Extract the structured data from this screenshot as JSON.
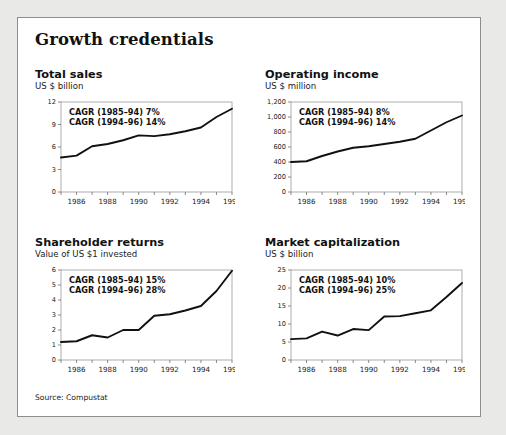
{
  "exhibit": {
    "title": "Growth credentials",
    "source": "Source: Compustat"
  },
  "panels": [
    {
      "id": "total-sales",
      "title": "Total sales",
      "subtitle": "US $ billion",
      "cagr_1": "CAGR (1985–94) 7%",
      "cagr_2": "CAGR (1994–96) 14%"
    },
    {
      "id": "operating-income",
      "title": "Operating income",
      "subtitle": "US $ million",
      "cagr_1": "CAGR (1985–94) 8%",
      "cagr_2": "CAGR (1994–96) 14%"
    },
    {
      "id": "shareholder-returns",
      "title": "Shareholder returns",
      "subtitle": "Value of US $1 invested",
      "cagr_1": "CAGR (1985–94) 15%",
      "cagr_2": "CAGR (1994–96) 28%"
    },
    {
      "id": "market-capitalization",
      "title": "Market capitalization",
      "subtitle": "US $ billion",
      "cagr_1": "CAGR (1985–94) 10%",
      "cagr_2": "CAGR (1994–96) 25%"
    }
  ],
  "chart_data": [
    {
      "type": "line",
      "id": "total-sales",
      "title": "Total sales",
      "subtitle": "US $ billion",
      "xlabel": "",
      "ylabel": "US $ billion",
      "x": [
        1985,
        1986,
        1987,
        1988,
        1989,
        1990,
        1991,
        1992,
        1993,
        1994,
        1995,
        1996
      ],
      "values": [
        4.6,
        4.85,
        6.1,
        6.4,
        6.9,
        7.55,
        7.45,
        7.7,
        8.1,
        8.6,
        10.0,
        11.1
      ],
      "ylim": [
        0,
        12
      ],
      "yticks": [
        0,
        3,
        6,
        9,
        12
      ],
      "ytick_labels": [
        "0",
        "3",
        "6",
        "9",
        "12"
      ],
      "xticks": [
        1985,
        1986,
        1987,
        1988,
        1989,
        1990,
        1991,
        1992,
        1993,
        1994,
        1995,
        1996
      ],
      "xtick_labels": [
        "",
        "1986",
        "",
        "1988",
        "",
        "1990",
        "",
        "1992",
        "",
        "1994",
        "",
        "1996"
      ],
      "grid": false,
      "legend": "none",
      "annotations": [
        "CAGR (1985–94) 7%",
        "CAGR (1994–96) 14%"
      ]
    },
    {
      "type": "line",
      "id": "operating-income",
      "title": "Operating income",
      "subtitle": "US $ million",
      "xlabel": "",
      "ylabel": "US $ million",
      "x": [
        1985,
        1986,
        1987,
        1988,
        1989,
        1990,
        1991,
        1992,
        1993,
        1994,
        1995,
        1996
      ],
      "values": [
        400,
        410,
        480,
        540,
        590,
        610,
        640,
        670,
        710,
        820,
        930,
        1020
      ],
      "ylim": [
        0,
        1200
      ],
      "yticks": [
        0,
        200,
        400,
        600,
        800,
        1000,
        1200
      ],
      "ytick_labels": [
        "0",
        "200",
        "400",
        "600",
        "800",
        "1,000",
        "1,200"
      ],
      "xticks": [
        1985,
        1986,
        1987,
        1988,
        1989,
        1990,
        1991,
        1992,
        1993,
        1994,
        1995,
        1996
      ],
      "xtick_labels": [
        "",
        "1986",
        "",
        "1988",
        "",
        "1990",
        "",
        "1992",
        "",
        "1994",
        "",
        "1996"
      ],
      "grid": false,
      "legend": "none",
      "annotations": [
        "CAGR (1985–94) 8%",
        "CAGR (1994–96) 14%"
      ]
    },
    {
      "type": "line",
      "id": "shareholder-returns",
      "title": "Shareholder returns",
      "subtitle": "Value of US $1 invested",
      "xlabel": "",
      "ylabel": "Value of US $1 invested",
      "x": [
        1985,
        1986,
        1987,
        1988,
        1989,
        1990,
        1991,
        1992,
        1993,
        1994,
        1995,
        1996
      ],
      "values": [
        1.2,
        1.25,
        1.65,
        1.5,
        2.0,
        2.0,
        2.95,
        3.05,
        3.3,
        3.6,
        4.6,
        5.95
      ],
      "ylim": [
        0,
        6
      ],
      "yticks": [
        0,
        1,
        2,
        3,
        4,
        5,
        6
      ],
      "ytick_labels": [
        "0",
        "1",
        "2",
        "3",
        "4",
        "5",
        "6"
      ],
      "xticks": [
        1985,
        1986,
        1987,
        1988,
        1989,
        1990,
        1991,
        1992,
        1993,
        1994,
        1995,
        1996
      ],
      "xtick_labels": [
        "",
        "1986",
        "",
        "1988",
        "",
        "1990",
        "",
        "1992",
        "",
        "1994",
        "",
        "1996"
      ],
      "grid": false,
      "legend": "none",
      "annotations": [
        "CAGR (1985–94) 15%",
        "CAGR (1994–96) 28%"
      ]
    },
    {
      "type": "line",
      "id": "market-capitalization",
      "title": "Market capitalization",
      "subtitle": "US $ billion",
      "xlabel": "",
      "ylabel": "US $ billion",
      "x": [
        1985,
        1986,
        1987,
        1988,
        1989,
        1990,
        1991,
        1992,
        1993,
        1994,
        1995,
        1996
      ],
      "values": [
        5.8,
        6.0,
        7.9,
        6.8,
        8.6,
        8.3,
        12.1,
        12.2,
        13.0,
        13.8,
        17.5,
        21.4
      ],
      "ylim": [
        0,
        25
      ],
      "yticks": [
        0,
        5,
        10,
        15,
        20,
        25
      ],
      "ytick_labels": [
        "0",
        "5",
        "10",
        "15",
        "20",
        "25"
      ],
      "xticks": [
        1985,
        1986,
        1987,
        1988,
        1989,
        1990,
        1991,
        1992,
        1993,
        1994,
        1995,
        1996
      ],
      "xtick_labels": [
        "",
        "1986",
        "",
        "1988",
        "",
        "1990",
        "",
        "1992",
        "",
        "1994",
        "",
        "1996"
      ],
      "grid": false,
      "legend": "none",
      "annotations": [
        "CAGR (1985–94) 10%",
        "CAGR (1994–96) 25%"
      ]
    }
  ]
}
